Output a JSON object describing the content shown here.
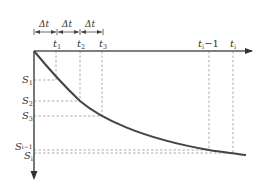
{
  "diagram": {
    "type": "settlement-time curve",
    "colors": {
      "axis": "#555555",
      "curve": "#444444",
      "dashed": "#8a8a8a",
      "text": "#333333"
    },
    "interval_label": "Δt",
    "interval_count": 3,
    "time_labels": [
      {
        "id": "t1",
        "text": "t",
        "sub": "1",
        "x": 56
      },
      {
        "id": "t2",
        "text": "t",
        "sub": "2",
        "x": 80
      },
      {
        "id": "t3",
        "text": "t",
        "sub": "3",
        "x": 102
      },
      {
        "id": "ti-1",
        "text": "t",
        "sub": "i",
        "suffix": "−1",
        "x": 209
      },
      {
        "id": "ti",
        "text": "t",
        "sub": "i",
        "x": 233
      }
    ],
    "settlement_labels": [
      {
        "id": "S1",
        "text": "S",
        "sub": "1",
        "y": 80
      },
      {
        "id": "S2",
        "text": "S",
        "sub": "2",
        "y": 101
      },
      {
        "id": "S3",
        "text": "S",
        "sub": "3",
        "y": 116
      },
      {
        "id": "Si-1",
        "text": "S",
        "sub": "i−1",
        "y": 150
      },
      {
        "id": "Si",
        "text": "S",
        "sub": "i",
        "y": 153
      }
    ]
  }
}
